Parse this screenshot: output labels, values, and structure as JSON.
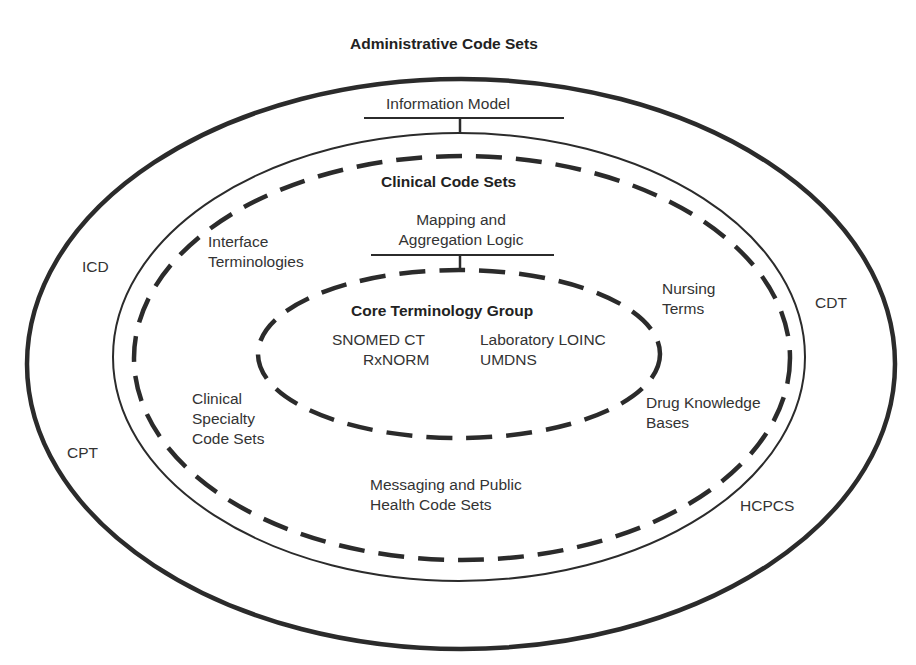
{
  "title": "Administrative Code Sets",
  "layers": {
    "administrative": {
      "title": "Administrative Code Sets",
      "items": [
        "ICD",
        "CDT",
        "CPT",
        "HCPCS"
      ]
    },
    "information_model": "Information Model",
    "clinical": {
      "title": "Clinical Code Sets",
      "mapping_line1": "Mapping and",
      "mapping_line2": "Aggregation Logic",
      "items": {
        "interface_line1": "Interface",
        "interface_line2": "Terminologies",
        "nursing_line1": "Nursing",
        "nursing_line2": "Terms",
        "specialty_line1": "Clinical",
        "specialty_line2": "Specialty",
        "specialty_line3": "Code Sets",
        "drug_line1": "Drug Knowledge",
        "drug_line2": "Bases",
        "messaging_line1": "Messaging and Public",
        "messaging_line2": "Health Code Sets"
      }
    },
    "core": {
      "title": "Core Terminology Group",
      "items": [
        "SNOMED CT",
        "Laboratory LOINC",
        "RxNORM",
        "UMDNS"
      ]
    }
  },
  "colors": {
    "stroke": "#2b2b2b",
    "text": "#333333",
    "background": "#ffffff"
  }
}
